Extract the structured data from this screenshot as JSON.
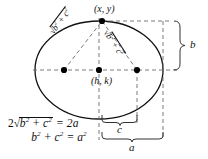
{
  "figure": {
    "colors": {
      "stroke": "#111111",
      "dashed": "#6b6b6b",
      "background": "#ffffff",
      "point_fill": "#000000"
    }
  },
  "labels": {
    "top_point": "(x, y)",
    "center_point": "(h, k)",
    "semi_minor": "b",
    "focal_distance": "c",
    "semi_major": "a"
  },
  "radicals": {
    "left": {
      "symbol": "√",
      "body_prefix": "b",
      "body_exp1": "2",
      "body_mid": " + c",
      "body_exp2": "2"
    },
    "right": {
      "symbol": "√",
      "body_prefix": "b",
      "body_exp1": "2",
      "body_mid": " + c",
      "body_exp2": "2"
    }
  },
  "equations": {
    "line1": {
      "coefficient": "2",
      "radical_symbol": "√",
      "radicand_prefix": "b",
      "radicand_exp1": "2",
      "radicand_mid": " + c",
      "radicand_exp2": "2",
      "relation": " = 2a"
    },
    "line2": {
      "lhs_prefix": "b",
      "lhs_exp1": "2",
      "lhs_mid": " + c",
      "lhs_exp2": "2",
      "relation": " = a",
      "rhs_exp": "2"
    }
  },
  "geometry": {
    "ellipse": {
      "cx": 99,
      "cy": 70,
      "rx": 64,
      "ry": 49
    },
    "points": [
      {
        "name": "top-vertex-point",
        "x": 102,
        "y": 21
      },
      {
        "name": "left-focus-point",
        "x": 64,
        "y": 70
      },
      {
        "name": "center-point",
        "x": 99,
        "y": 70
      },
      {
        "name": "right-focus-point",
        "x": 137,
        "y": 70
      }
    ]
  }
}
